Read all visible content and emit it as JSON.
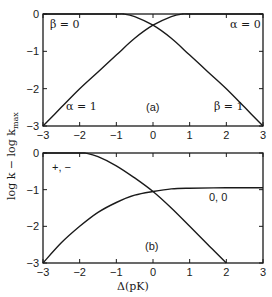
{
  "chart_data": [
    {
      "type": "line",
      "panel_label": "(a)",
      "title": "",
      "xlabel": "",
      "ylabel": "log k − log k_max",
      "xlim": [
        -3,
        3
      ],
      "ylim": [
        -3,
        0
      ],
      "x_ticks": [
        "−3",
        "−2",
        "−1",
        "0",
        "1",
        "2",
        "3"
      ],
      "y_ticks": [
        "0",
        "−1",
        "−2",
        "−3"
      ],
      "grid": false,
      "annotations": [
        "β = 0",
        "α = 0",
        "α = 1",
        "β = 1",
        "(a)"
      ],
      "series": [
        {
          "name": "α = 1 / α = 0 (rising curve)",
          "x": [
            -3,
            -2.5,
            -2,
            -1.5,
            -1,
            -0.5,
            0,
            0.5,
            0.8,
            1,
            2,
            3
          ],
          "y": [
            -3,
            -2.5,
            -2.0,
            -1.55,
            -1.1,
            -0.65,
            -0.3,
            -0.07,
            0,
            0,
            0,
            0
          ]
        },
        {
          "name": "β = 0 / β = 1 (falling curve)",
          "x": [
            -3,
            -2,
            -1,
            -0.8,
            -0.5,
            0,
            0.5,
            1,
            1.5,
            2,
            2.5,
            3
          ],
          "y": [
            0,
            0,
            0,
            0,
            -0.07,
            -0.3,
            -0.65,
            -1.1,
            -1.55,
            -2.0,
            -2.5,
            -3
          ]
        }
      ]
    },
    {
      "type": "line",
      "panel_label": "(b)",
      "title": "",
      "xlabel": "Δ(pK)",
      "ylabel": "log k − log k_max",
      "xlim": [
        -3,
        3
      ],
      "ylim": [
        -3,
        0
      ],
      "x_ticks": [
        "−3",
        "−2",
        "−1",
        "0",
        "1",
        "2",
        "3"
      ],
      "y_ticks": [
        "0",
        "−1",
        "−2",
        "−3"
      ],
      "grid": false,
      "annotations": [
        "+, −",
        "0, 0",
        "(b)"
      ],
      "series": [
        {
          "name": "+, −",
          "x": [
            -3,
            -2,
            -1.8,
            -1.5,
            -1,
            -0.5,
            0,
            0.5,
            1,
            1.5,
            2
          ],
          "y": [
            0,
            0,
            -0.01,
            -0.1,
            -0.35,
            -0.68,
            -1.05,
            -1.5,
            -2.0,
            -2.5,
            -3
          ]
        },
        {
          "name": "0, 0",
          "x": [
            -3,
            -2.5,
            -2,
            -1.5,
            -1,
            -0.5,
            0,
            0.5,
            1,
            2,
            3
          ],
          "y": [
            -3,
            -2.45,
            -2.0,
            -1.62,
            -1.35,
            -1.15,
            -1.05,
            -0.98,
            -0.96,
            -0.95,
            -0.95
          ]
        }
      ]
    }
  ],
  "labels": {
    "y_axis": "log k − log k",
    "y_axis_sub": "max",
    "x_axis": "Δ(pK)",
    "panel_a": "(a)",
    "panel_b": "(b)",
    "a_beta0": "β = 0",
    "a_alpha0": "α = 0",
    "a_alpha1": "α = 1",
    "a_beta1": "β = 1",
    "b_pm": "+, −",
    "b_00": "0, 0",
    "x_ticks": [
      "−3",
      "−2",
      "−1",
      "0",
      "1",
      "2",
      "3"
    ],
    "y_ticks": [
      "0",
      "−1",
      "−2",
      "−3"
    ]
  }
}
